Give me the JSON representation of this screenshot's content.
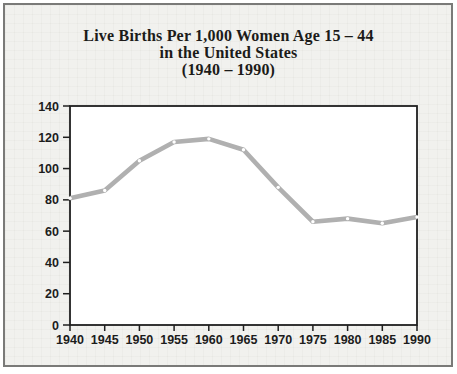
{
  "title": {
    "line1": "Live Births Per 1,000 Women Age 15 – 44",
    "line2": "in the United States",
    "line3": "(1940 – 1990)"
  },
  "chart_data": {
    "type": "line",
    "title": "Live Births Per 1,000 Women Age 15 – 44 in the United States (1940 – 1990)",
    "categories": [
      "1940",
      "1945",
      "1950",
      "1955",
      "1960",
      "1965",
      "1970",
      "1975",
      "1980",
      "1985",
      "1990"
    ],
    "values": [
      81,
      86,
      105,
      117,
      119,
      112,
      88,
      66,
      68,
      65,
      69
    ],
    "xlabel": "",
    "ylabel": "",
    "ylim": [
      0,
      140
    ],
    "yticks": [
      0,
      20,
      40,
      60,
      80,
      100,
      120,
      140
    ],
    "grid": false,
    "legend": "none",
    "line_color": "#b0b0b0",
    "marker_color": "#ffffff",
    "axis_color": "#1f1f1f",
    "plot_background": "#ffffff",
    "card_background": "#f1f1ee",
    "frame_border_color": "#7a7a78"
  }
}
